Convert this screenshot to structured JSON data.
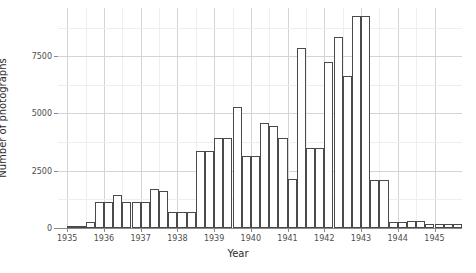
{
  "chart_data": {
    "type": "bar",
    "title": "",
    "subtitle": "",
    "xlabel": "Year",
    "ylabel": "Number of photographs",
    "xlim": [
      1934.75,
      1945.75
    ],
    "ylim": [
      0,
      9600
    ],
    "grid": true,
    "legend": false,
    "legend_position": "none",
    "bin_width_years": 0.25,
    "x_ticks": [
      1935,
      1936,
      1937,
      1938,
      1939,
      1940,
      1941,
      1942,
      1943,
      1944,
      1945
    ],
    "x_tick_labels": [
      "1935",
      "1936",
      "1937",
      "1938",
      "1939",
      "1940",
      "1941",
      "1942",
      "1943",
      "1944",
      "1945"
    ],
    "y_ticks": [
      0,
      2500,
      5000,
      7500
    ],
    "y_tick_labels": [
      "0",
      "2500",
      "5000",
      "7500"
    ],
    "bar_fill": "#ffffff",
    "bar_edge": "#4a4a4a",
    "categories": [
      "1935.00",
      "1935.25",
      "1935.50",
      "1935.75",
      "1936.00",
      "1936.25",
      "1936.50",
      "1936.75",
      "1937.00",
      "1937.25",
      "1937.50",
      "1937.75",
      "1938.00",
      "1938.25",
      "1938.50",
      "1938.75",
      "1939.00",
      "1939.25",
      "1939.50",
      "1939.75",
      "1940.00",
      "1940.25",
      "1940.50",
      "1940.75",
      "1941.00",
      "1941.25",
      "1941.50",
      "1941.75",
      "1942.00",
      "1942.25",
      "1942.50",
      "1942.75",
      "1943.00",
      "1943.25",
      "1943.50",
      "1943.75",
      "1944.00",
      "1944.25",
      "1944.50",
      "1944.75",
      "1945.00",
      "1945.25",
      "1945.50"
    ],
    "values": [
      60,
      60,
      260,
      1150,
      1150,
      1450,
      1150,
      1150,
      1150,
      1700,
      1600,
      700,
      700,
      700,
      3350,
      3350,
      3950,
      3950,
      5300,
      3150,
      3150,
      4600,
      4450,
      3950,
      2150,
      7850,
      3500,
      3500,
      7250,
      8350,
      6650,
      9250,
      9250,
      2100,
      2100,
      250,
      250,
      300,
      300,
      160,
      160,
      160,
      160
    ],
    "x_values": [
      1935.0,
      1935.25,
      1935.5,
      1935.75,
      1936.0,
      1936.25,
      1936.5,
      1936.75,
      1937.0,
      1937.25,
      1937.5,
      1937.75,
      1938.0,
      1938.25,
      1938.5,
      1938.75,
      1939.0,
      1939.25,
      1939.5,
      1939.75,
      1940.0,
      1940.25,
      1940.5,
      1940.75,
      1941.0,
      1941.25,
      1941.5,
      1941.75,
      1942.0,
      1942.25,
      1942.5,
      1942.75,
      1943.0,
      1943.25,
      1943.5,
      1943.75,
      1944.0,
      1944.25,
      1944.5,
      1944.75,
      1945.0,
      1945.25,
      1945.5
    ],
    "annotations": []
  }
}
